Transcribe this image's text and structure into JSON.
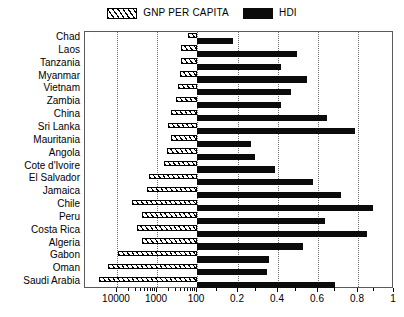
{
  "legend": {
    "entries": [
      {
        "label": "GNP PER CAPITA",
        "swatch": "hatched-swatch-icon",
        "color": "#000000"
      },
      {
        "label": "HDI",
        "swatch": "solid-swatch-icon",
        "color": "#0b0b0b"
      }
    ]
  },
  "chart_data": {
    "type": "bar",
    "orientation": "horizontal",
    "title": "",
    "subtitle": "",
    "xlabel": "",
    "ylabel": "",
    "grid": true,
    "legend_position": "top-center",
    "note": "Dual x-axis: GNP per capita uses a reversed logarithmic scale (10000 to 100) on the left half; HDI uses a linear scale (0.0 to 1.0) on the right half. Both bar sets meet at the shared center boundary at 100 / 0.0.",
    "categories": [
      "Chad",
      "Laos",
      "Tanzania",
      "Myanmar",
      "Vietnam",
      "Zambia",
      "China",
      "Sri Lanka",
      "Mauritania",
      "Angola",
      "Cote d'Ivoire",
      "El Salvador",
      "Jamaica",
      "Chile",
      "Peru",
      "Costa Rica",
      "Algeria",
      "Gabon",
      "Oman",
      "Saudi Arabia"
    ],
    "series": [
      {
        "name": "GNP PER CAPITA",
        "axis": "log-left",
        "xlim": [
          10000,
          100
        ],
        "tick_labels": [
          "10000",
          "1000",
          "100"
        ],
        "values": [
          210,
          320,
          320,
          330,
          360,
          400,
          530,
          600,
          520,
          620,
          700,
          1400,
          1500,
          2900,
          1800,
          2200,
          1800,
          4300,
          6000,
          7800
        ]
      },
      {
        "name": "HDI",
        "axis": "linear-right",
        "xlim": [
          0.0,
          1.0
        ],
        "tick_labels": [
          "0.2",
          "0.4",
          "0.6",
          "0.8",
          "1"
        ],
        "values": [
          0.18,
          0.5,
          0.42,
          0.55,
          0.47,
          0.42,
          0.65,
          0.79,
          0.27,
          0.29,
          0.39,
          0.58,
          0.72,
          0.88,
          0.64,
          0.85,
          0.53,
          0.37,
          0.36,
          0.69
        ]
      }
    ],
    "bar_pixel_geometry": {
      "plot_left_px": 84,
      "plot_right_px": 393,
      "center_boundary_px": 196,
      "gnp_gridlines_px": [
        116,
        156,
        196
      ],
      "hdi_gridlines_px": [
        237,
        277,
        317,
        357
      ],
      "gnp_bar_left_px": [
        187,
        180,
        180,
        179,
        177,
        175,
        170,
        167,
        170,
        166,
        163,
        148,
        146,
        131,
        141,
        136,
        141,
        117,
        107,
        98
      ],
      "hdi_bar_right_px": [
        232,
        296,
        280,
        306,
        290,
        280,
        326,
        354,
        250,
        254,
        274,
        312,
        340,
        372,
        324,
        366,
        302,
        268,
        266,
        334
      ]
    }
  },
  "axis": {
    "x_ticks": [
      {
        "label": "10000",
        "px": 116
      },
      {
        "label": "1000",
        "px": 156
      },
      {
        "label": "100",
        "px": 196
      },
      {
        "label": "0.2",
        "px": 237
      },
      {
        "label": "0.4",
        "px": 277
      },
      {
        "label": "0.6",
        "px": 317
      },
      {
        "label": "0.8",
        "px": 357
      },
      {
        "label": "1",
        "px": 393
      }
    ]
  }
}
